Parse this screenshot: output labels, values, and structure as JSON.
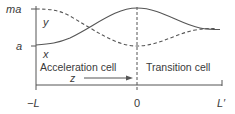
{
  "diagram": {
    "y_axis": {
      "ticks": [
        {
          "label": "ma",
          "y": 9
        },
        {
          "label": "a",
          "y": 46
        }
      ]
    },
    "x_axis": {
      "ticks": [
        {
          "label": "−L",
          "x": 36
        },
        {
          "label": "0",
          "x": 137
        },
        {
          "label": "L′",
          "x": 222
        }
      ]
    },
    "curves": {
      "solid": {
        "label": "x"
      },
      "dashed": {
        "label": "y"
      }
    },
    "regions": {
      "left": "Acceleration cell",
      "right": "Transition cell"
    },
    "arrow_label": "z",
    "colors": {
      "line": "#555555",
      "text": "#3a3a3a",
      "background": "#ffffff"
    }
  }
}
